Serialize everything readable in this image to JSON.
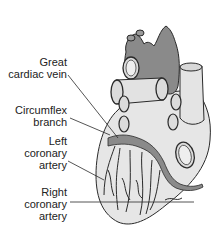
{
  "diagram": {
    "colors": {
      "vessel_dark": "#8a8a8a",
      "heart_fill": "#e6e6e6",
      "outline": "#2a2a2a",
      "label_text": "#222222",
      "background": "#ffffff"
    },
    "labels": [
      {
        "id": "great-cardiac-vein",
        "lines": [
          "Great",
          "cardiac vein"
        ]
      },
      {
        "id": "circumflex-branch",
        "lines": [
          "Circumflex",
          "branch"
        ]
      },
      {
        "id": "left-coronary-artery",
        "lines": [
          "Left",
          "coronary",
          "artery"
        ]
      },
      {
        "id": "right-coronary-artery",
        "lines": [
          "Right",
          "coronary",
          "artery"
        ]
      }
    ]
  }
}
